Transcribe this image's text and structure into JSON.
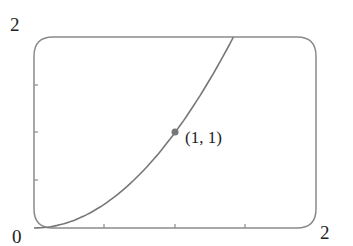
{
  "chart_data": {
    "type": "line",
    "title": "",
    "xlabel": "",
    "ylabel": "",
    "xlim": [
      0,
      2
    ],
    "ylim": [
      0,
      2
    ],
    "x_tick_labels": [
      "0",
      "2"
    ],
    "y_tick_labels": [
      "2"
    ],
    "x_ticks": [
      0.5,
      1,
      1.5
    ],
    "y_ticks": [
      0.5,
      1,
      1.5
    ],
    "series": [
      {
        "name": "y = x^2",
        "x": [
          0,
          0.25,
          0.5,
          0.75,
          1,
          1.25,
          1.414
        ],
        "y": [
          0,
          0.0625,
          0.25,
          0.5625,
          1,
          1.5625,
          2
        ]
      }
    ],
    "annotations": [
      {
        "x": 1,
        "y": 1,
        "text": "(1, 1)"
      }
    ],
    "grid": false
  },
  "labels": {
    "origin": "0",
    "x_max": "2",
    "y_max": "2",
    "point": "(1, 1)"
  },
  "colors": {
    "axis": "#8a8a8a",
    "curve": "#777777",
    "point": "#777777"
  }
}
